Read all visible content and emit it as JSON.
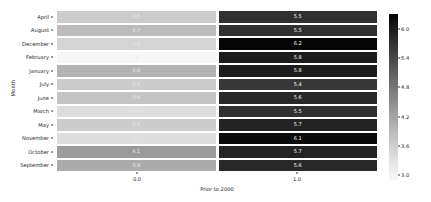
{
  "chart_data": {
    "type": "heatmap",
    "title": "",
    "xlabel": "Prior to 2000",
    "ylabel": "Month",
    "categories_x": [
      "0.0",
      "1.0"
    ],
    "categories_y": [
      "April",
      "August",
      "December",
      "February",
      "January",
      "July",
      "June",
      "March",
      "May",
      "November",
      "October",
      "September"
    ],
    "values": [
      [
        3.5,
        5.5
      ],
      [
        3.7,
        5.5
      ],
      [
        3.4,
        6.2
      ],
      [
        3.0,
        5.8
      ],
      [
        3.8,
        5.8
      ],
      [
        3.5,
        5.4
      ],
      [
        3.6,
        5.6
      ],
      [
        3.3,
        5.5
      ],
      [
        3.5,
        5.7
      ],
      [
        3.3,
        6.1
      ],
      [
        4.1,
        5.7
      ],
      [
        3.9,
        5.6
      ]
    ],
    "annotations": [
      [
        "3.5",
        "5.5"
      ],
      [
        "3.7",
        "5.5"
      ],
      [
        "3.4",
        "6.2"
      ],
      [
        "3",
        "5.8"
      ],
      [
        "3.8",
        "5.8"
      ],
      [
        "3.5",
        "5.4"
      ],
      [
        "3.6",
        "5.6"
      ],
      [
        "3.3",
        "5.5"
      ],
      [
        "3.5",
        "5.7"
      ],
      [
        "3.3",
        "6.1"
      ],
      [
        "4.1",
        "5.7"
      ],
      [
        "3.9",
        "5.6"
      ]
    ],
    "xtick_labels": [
      "0.0",
      "1.0"
    ],
    "colorbar": {
      "ticks": [
        "6.0",
        "5.4",
        "4.8",
        "4.2",
        "3.6",
        "3.0"
      ],
      "tick_values": [
        6.0,
        5.4,
        4.8,
        4.2,
        3.6,
        3.0
      ],
      "vmin": 2.9,
      "vmax": 6.3,
      "colormap": "gray-reversed",
      "orientation": "vertical",
      "position": "right"
    },
    "grid": false,
    "legend": "colorbar"
  }
}
